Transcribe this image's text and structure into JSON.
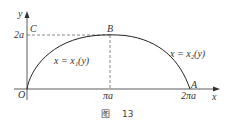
{
  "figure": {
    "caption_prefix": "图",
    "caption_number": "13",
    "axes": {
      "x_label": "x",
      "y_label": "y",
      "origin_label": "O"
    },
    "ticks": {
      "y_2a": "2a",
      "x_pia": "πa",
      "x_2pia": "2πa"
    },
    "points": {
      "A": "A",
      "B": "B",
      "C": "C"
    },
    "curve_labels": {
      "left": "x = x₁(y)",
      "right": "x = x₂(y)"
    },
    "colors": {
      "curve": "#222222",
      "axis": "#333333",
      "dash": "#555555"
    }
  }
}
